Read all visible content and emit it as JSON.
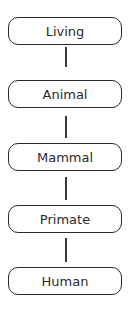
{
  "diagram": {
    "type": "hierarchy",
    "orientation": "vertical",
    "nodes": [
      {
        "label": "Living"
      },
      {
        "label": "Animal"
      },
      {
        "label": "Mammal"
      },
      {
        "label": "Primate"
      },
      {
        "label": "Human"
      }
    ],
    "edges": [
      {
        "from": "Living",
        "to": "Animal"
      },
      {
        "from": "Animal",
        "to": "Mammal"
      },
      {
        "from": "Mammal",
        "to": "Primate"
      },
      {
        "from": "Primate",
        "to": "Human"
      }
    ],
    "colors": {
      "stroke": "#2a2a2a",
      "text": "#2b2b2b",
      "background": "#ffffff"
    }
  }
}
